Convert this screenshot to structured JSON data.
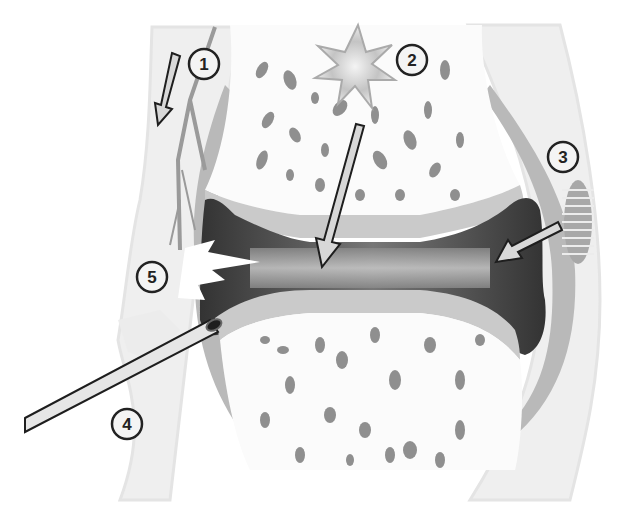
{
  "diagram": {
    "type": "anatomical-illustration",
    "callouts": [
      {
        "id": "1",
        "label": "1",
        "x": 204,
        "y": 64
      },
      {
        "id": "2",
        "label": "2",
        "x": 412,
        "y": 60
      },
      {
        "id": "3",
        "label": "3",
        "x": 563,
        "y": 157
      },
      {
        "id": "4",
        "label": "4",
        "x": 127,
        "y": 424
      },
      {
        "id": "5",
        "label": "5",
        "x": 152,
        "y": 277
      }
    ],
    "colors": {
      "background": "#ffffff",
      "soft_tissue": "#f0f0f0",
      "soft_tissue_edge": "#e2e2e2",
      "bone": "#fbfbfb",
      "trabecular_holes": "#8f8f8f",
      "capsule": "#b8b8b8",
      "cartilage": "#c9c9c9",
      "synovial_cavity": "#3f3f3f",
      "nerve": "#9a9a9a",
      "arrow_fill": "#d8d8d8",
      "arrow_outline": "#1e1e1e",
      "callout_border": "#222222"
    }
  }
}
